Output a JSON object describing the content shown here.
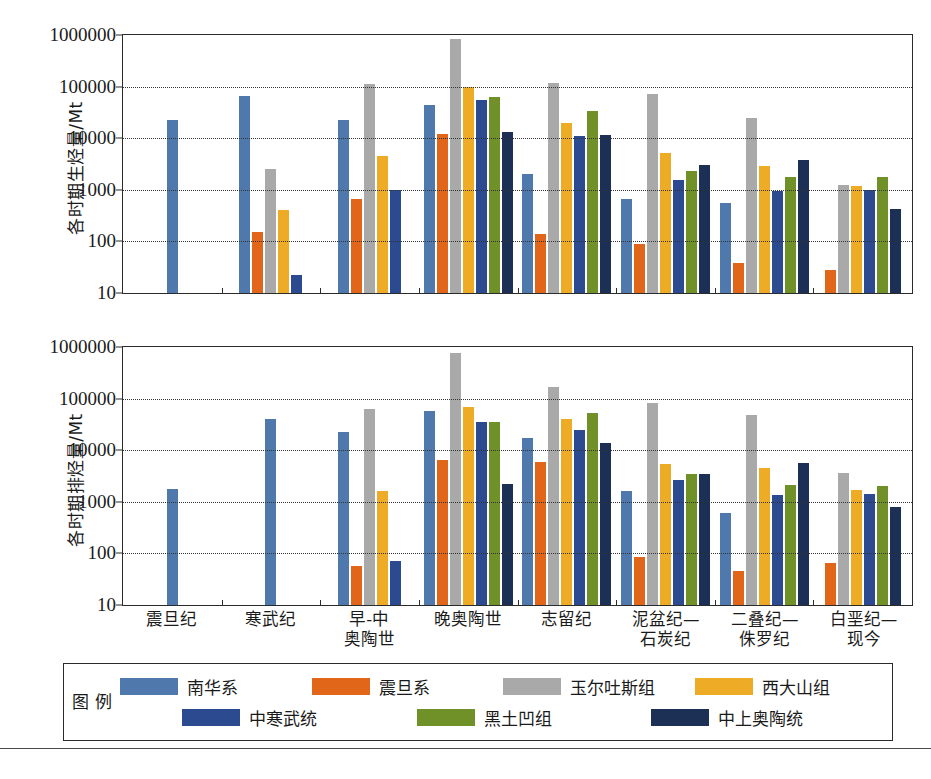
{
  "colors": {
    "nanhua": "#4f78ad",
    "zhendan": "#e1661a",
    "yuertusi": "#a9a9a9",
    "xidashan": "#eeab25",
    "zhonghanwu": "#2b4a8f",
    "heituao": "#6f9128",
    "zhongshangaotao": "#1b3054",
    "axis": "#2b2b2b",
    "grid": "#333333"
  },
  "axis": {
    "yticks": [
      "1000000",
      "100000",
      "10000",
      "1000",
      "100",
      "10"
    ],
    "ymin": 10,
    "ymax": 1000000
  },
  "legend": {
    "title_line1": "图",
    "title_line2": "例",
    "items": [
      {
        "label": "南华系",
        "color_key": "nanhua"
      },
      {
        "label": "震旦系",
        "color_key": "zhendan"
      },
      {
        "label": "玉尔吐斯组",
        "color_key": "yuertusi"
      },
      {
        "label": "西大山组",
        "color_key": "xidashan"
      },
      {
        "label": "中寒武统",
        "color_key": "zhonghanwu"
      },
      {
        "label": "黑土凹组",
        "color_key": "heituao"
      },
      {
        "label": "中上奥陶统",
        "color_key": "zhongshangaotao"
      }
    ]
  },
  "xlabels": [
    {
      "line1": "震旦纪",
      "line2": ""
    },
    {
      "line1": "寒武纪",
      "line2": ""
    },
    {
      "line1": "早-中",
      "line2": "奥陶世"
    },
    {
      "line1": "晚奥陶世",
      "line2": ""
    },
    {
      "line1": "志留纪",
      "line2": ""
    },
    {
      "line1": "泥盆纪—",
      "line2": "石炭纪"
    },
    {
      "line1": "二叠纪—",
      "line2": "侏罗纪"
    },
    {
      "line1": "白垩纪—",
      "line2": "现今"
    }
  ],
  "caption": "",
  "chart_data": [
    {
      "type": "bar",
      "id": "hydrocarbon-generation",
      "title": "",
      "ylabel": "各时期生烃量/Mt",
      "xlabel": "",
      "yscale": "log",
      "ylim": [
        10,
        1000000
      ],
      "grid": true,
      "legend_position": "bottom",
      "categories": [
        "震旦纪",
        "寒武纪",
        "早-中奥陶世",
        "晚奥陶世",
        "志留纪",
        "泥盆纪—石炭纪",
        "二叠纪—侏罗纪",
        "白垩纪—现今"
      ],
      "series": [
        {
          "name": "南华系",
          "color_key": "nanhua",
          "values": [
            23000,
            65000,
            23000,
            45000,
            2000,
            650,
            550,
            null
          ]
        },
        {
          "name": "震旦系",
          "color_key": "zhendan",
          "values": [
            null,
            150,
            650,
            12000,
            140,
            90,
            38,
            28
          ]
        },
        {
          "name": "玉尔吐斯组",
          "color_key": "yuertusi",
          "values": [
            null,
            2500,
            110000,
            850000,
            120000,
            72000,
            25000,
            1250
          ]
        },
        {
          "name": "西大山组",
          "color_key": "xidashan",
          "values": [
            null,
            400,
            4500,
            100000,
            20000,
            5200,
            2900,
            1200
          ]
        },
        {
          "name": "中寒武统",
          "color_key": "zhonghanwu",
          "values": [
            null,
            22,
            1000,
            55000,
            11000,
            1550,
            950,
            980
          ]
        },
        {
          "name": "黑土凹组",
          "color_key": "heituao",
          "values": [
            null,
            null,
            null,
            62000,
            33000,
            2300,
            1800,
            1750
          ]
        },
        {
          "name": "中上奥陶统",
          "color_key": "zhongshangaotao",
          "values": [
            null,
            null,
            null,
            13000,
            11500,
            3000,
            3800,
            430
          ]
        }
      ]
    },
    {
      "type": "bar",
      "id": "hydrocarbon-expulsion",
      "title": "",
      "ylabel": "各时期排烃量/Mt",
      "xlabel": "",
      "yscale": "log",
      "ylim": [
        10,
        1000000
      ],
      "grid": true,
      "legend_position": "bottom",
      "categories": [
        "震旦纪",
        "寒武纪",
        "早-中奥陶世",
        "晚奥陶世",
        "志留纪",
        "泥盆纪—石炭纪",
        "二叠纪—侏罗纪",
        "白垩纪—现今"
      ],
      "series": [
        {
          "name": "南华系",
          "color_key": "nanhua",
          "values": [
            1800,
            40000,
            23000,
            58000,
            17000,
            1600,
            600,
            null
          ]
        },
        {
          "name": "震旦系",
          "color_key": "zhendan",
          "values": [
            null,
            null,
            58,
            6500,
            5800,
            85,
            46,
            66
          ]
        },
        {
          "name": "玉尔吐斯组",
          "color_key": "yuertusi",
          "values": [
            null,
            null,
            62000,
            750000,
            170000,
            82000,
            48000,
            3600
          ]
        },
        {
          "name": "西大山组",
          "color_key": "xidashan",
          "values": [
            null,
            null,
            1600,
            68000,
            40000,
            5400,
            4500,
            1700
          ]
        },
        {
          "name": "中寒武统",
          "color_key": "zhonghanwu",
          "values": [
            null,
            null,
            72,
            36000,
            25000,
            2700,
            1350,
            1400
          ]
        },
        {
          "name": "黑土凹组",
          "color_key": "heituao",
          "values": [
            null,
            null,
            null,
            35000,
            52000,
            3500,
            2100,
            2000
          ]
        },
        {
          "name": "中上奥陶统",
          "color_key": "zhongshangaotao",
          "values": [
            null,
            null,
            null,
            2200,
            14000,
            3500,
            5600,
            780
          ]
        }
      ]
    }
  ]
}
